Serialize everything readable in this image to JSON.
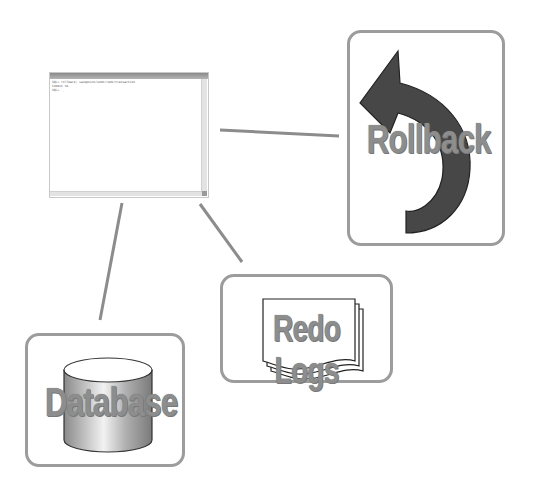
{
  "diagram": {
    "terminal": {
      "lines": [
        "SQL> rollback; savepoint/undo/redo/transaction",
        "Commit ok",
        "SQL>  _"
      ]
    },
    "components": [
      {
        "id": "rollback",
        "label": "Rollback",
        "icon": "curved-arrow-undo-icon"
      },
      {
        "id": "redo_logs",
        "label": "Redo Logs",
        "icon": "stacked-documents-icon"
      },
      {
        "id": "database",
        "label": "Database",
        "icon": "database-cylinder-icon"
      }
    ],
    "connections": [
      {
        "from": "terminal",
        "to": "rollback"
      },
      {
        "from": "terminal",
        "to": "redo_logs"
      },
      {
        "from": "terminal",
        "to": "database"
      }
    ],
    "colors": {
      "border": "#9c9c9c",
      "connector": "#8c8c8c",
      "label": "#8d8d8d",
      "arrow": "#474747"
    }
  }
}
